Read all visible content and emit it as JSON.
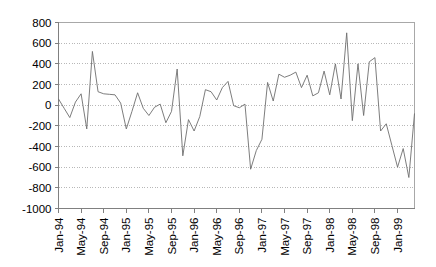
{
  "chart_data": {
    "type": "line",
    "title": "",
    "subtitle": "",
    "xlabel": "",
    "ylabel": "",
    "ylim": [
      -1000,
      800
    ],
    "ytick_values": [
      800,
      600,
      400,
      200,
      0,
      -200,
      -400,
      -600,
      -800,
      -1000
    ],
    "ytick_labels": [
      "800",
      "600",
      "400",
      "200",
      "0",
      "-200",
      "-400",
      "-600",
      "-800",
      "-1000"
    ],
    "grid": true,
    "grid_axis": "y",
    "legend": false,
    "legend_position": "none",
    "xtick_labels": [
      "Jan-94",
      "May-94",
      "Sep-94",
      "Jan-95",
      "May-95",
      "Sep-95",
      "Jan-96",
      "May-96",
      "Sep-96",
      "Jan-97",
      "May-97",
      "Sep-97",
      "Jan-98",
      "May-98",
      "Sep-98",
      "Jan-99"
    ],
    "xtick_rotation": -90,
    "x_start_label": "Jan-94",
    "x_end_label": "Jan-99",
    "x_tick_interval_months": 4,
    "series_color": "#6e6e6e",
    "x": [
      "Jan-94",
      "Feb-94",
      "Mar-94",
      "Apr-94",
      "May-94",
      "Jun-94",
      "Jul-94",
      "Aug-94",
      "Sep-94",
      "Oct-94",
      "Nov-94",
      "Dec-94",
      "Jan-95",
      "Feb-95",
      "Mar-95",
      "Apr-95",
      "May-95",
      "Jun-95",
      "Jul-95",
      "Aug-95",
      "Sep-95",
      "Oct-95",
      "Nov-95",
      "Dec-95",
      "Jan-96",
      "Feb-96",
      "Mar-96",
      "Apr-96",
      "May-96",
      "Jun-96",
      "Jul-96",
      "Aug-96",
      "Sep-96",
      "Oct-96",
      "Nov-96",
      "Dec-96",
      "Jan-97",
      "Feb-97",
      "Mar-97",
      "Apr-97",
      "May-97",
      "Jun-97",
      "Jul-97",
      "Aug-97",
      "Sep-97",
      "Oct-97",
      "Nov-97",
      "Dec-97",
      "Jan-98",
      "Feb-98",
      "Mar-98",
      "Apr-98",
      "May-98",
      "Jun-98",
      "Jul-98",
      "Aug-98",
      "Sep-98",
      "Oct-98",
      "Nov-98",
      "Dec-98",
      "Jan-99",
      "Feb-99",
      "Mar-99",
      "Apr-99"
    ],
    "values": [
      60,
      -30,
      -120,
      30,
      110,
      -230,
      520,
      130,
      110,
      105,
      100,
      20,
      -230,
      -60,
      120,
      -30,
      -100,
      -20,
      10,
      -170,
      -60,
      350,
      -490,
      -140,
      -250,
      -110,
      150,
      130,
      50,
      170,
      230,
      -5,
      -25,
      10,
      -620,
      -440,
      -330,
      220,
      40,
      300,
      270,
      290,
      320,
      170,
      290,
      90,
      120,
      330,
      100,
      400,
      60,
      700,
      -150,
      400,
      -100,
      420,
      460,
      -250,
      -180,
      -390,
      -600,
      -420,
      -700,
      -80
    ]
  },
  "axes": {
    "y_axis_name": "value-axis",
    "x_axis_name": "time-axis"
  }
}
